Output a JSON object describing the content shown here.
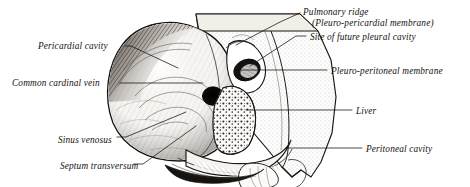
{
  "figure": {
    "ink_color": "#14110f",
    "background_color": "#ffffff",
    "width": 470,
    "height": 187
  },
  "labels": {
    "pericardial_cavity": "Pericardial cavity",
    "common_cardinal_vein": "Common cardinal vein",
    "sinus_venosus": "Sinus venosus",
    "septum_transversum": "Septum transversum",
    "pulmonary_ridge": "Pulmonary ridge",
    "pleuro_pericardial_membrane": "(Pleuro-pericardial membrane)",
    "site_of_future_pleural_cavity": "Site of future pleural cavity",
    "pleuro_peritoneal_membrane": "Pleuro-peritoneal membrane",
    "liver": "Liver",
    "peritoneal_cavity": "Peritoneal cavity"
  }
}
